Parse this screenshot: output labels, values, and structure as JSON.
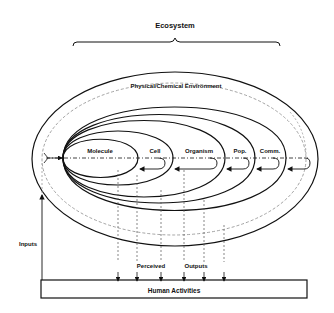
{
  "diagram": {
    "title": "Ecosystem",
    "environment_label": "Physical/Chemical Environment",
    "levels": [
      {
        "label": "Molecule"
      },
      {
        "label": "Cell"
      },
      {
        "label": "Organism"
      },
      {
        "label": "Pop."
      },
      {
        "label": "Comm."
      }
    ],
    "inputs_label": "Inputs",
    "perceived_label": "Perceived",
    "outputs_label": "Outputs",
    "human_activities_label": "Human Activities"
  },
  "colors": {
    "line": "#111111",
    "dashed": "#888888",
    "background": "#ffffff"
  }
}
